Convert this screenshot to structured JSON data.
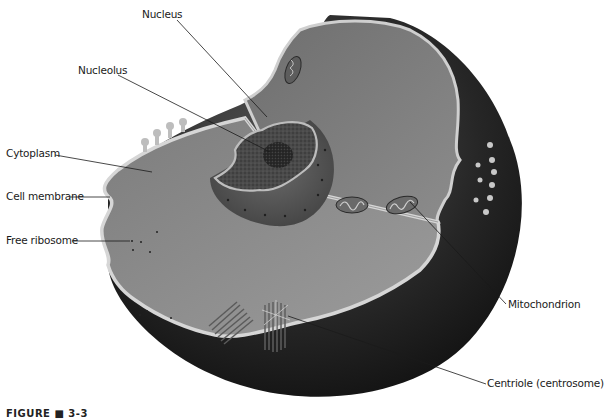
{
  "figure": {
    "caption": "FIGURE ■ 3-3"
  },
  "labels": {
    "nucleus": "Nucleus",
    "nucleolus": "Nucleolus",
    "cytoplasm": "Cytoplasm",
    "cell_membrane": "Cell membrane",
    "free_ribosome": "Free ribosome",
    "mitochondrion": "Mitochondrion",
    "centriole": "Centriole (centrosome)"
  },
  "colors": {
    "background": "#ffffff",
    "cell_outer_dark": "#1e1e1e",
    "cytoplasm_cut_face": "#8a8a8a",
    "cytoplasm_inner": "#777777",
    "membrane_edge": "#d2d2d2",
    "nucleus": "#5a5a5a",
    "nucleolus": "#2e2e2e",
    "leader_line": "#1a1a1a"
  }
}
